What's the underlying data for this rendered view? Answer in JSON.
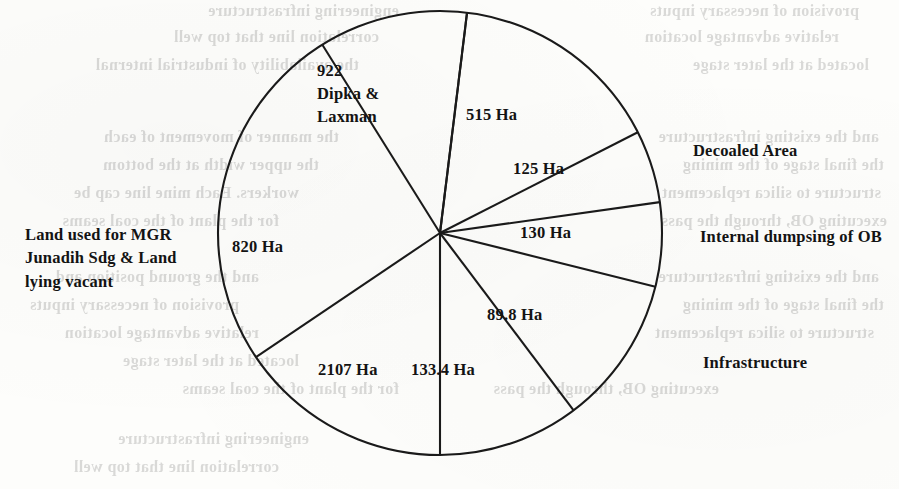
{
  "document": {
    "type": "scanned-page-pie-chart",
    "ink_color": "#1a1a1a",
    "paper_color": "#fdfdfb"
  },
  "chart_data": {
    "type": "pie",
    "title": "",
    "unit": "Ha",
    "legend_position": "callout-labels",
    "grid": false,
    "categories": [
      "515 Ha",
      "125 Ha",
      "130 Ha",
      "89.8 Ha",
      "133.4 Ha",
      "2107 Ha",
      "820 Ha",
      "922 Dipka & Laxman"
    ],
    "values": [
      515,
      125,
      130,
      89.8,
      133.4,
      2107,
      820,
      922
    ],
    "labels": [
      "515 Ha",
      "125 Ha",
      "130 Ha",
      "89.8 Ha",
      "133.4 Ha",
      "2107 Ha",
      "820 Ha",
      "922"
    ],
    "category_names": [
      "Decoaled Area",
      "",
      "Internal dumpsing of OB",
      "Infrastructure",
      "",
      "",
      "Land used for MGR Junadih Sdg & Land lying vacant",
      "Dipka & Laxman"
    ],
    "slices": [
      {
        "label": "515 Ha",
        "value": 515,
        "start_deg": -83,
        "end_deg": -27
      },
      {
        "label": "125 Ha",
        "value": 125,
        "start_deg": -27,
        "end_deg": -8
      },
      {
        "label": "130 Ha",
        "value": 130,
        "start_deg": -8,
        "end_deg": 14
      },
      {
        "label": "89.8 Ha",
        "value": 89.8,
        "start_deg": 14,
        "end_deg": 53
      },
      {
        "label": "133.4 Ha",
        "value": 133.4,
        "start_deg": 53,
        "end_deg": 90
      },
      {
        "label": "2107 Ha",
        "value": 2107,
        "start_deg": 90,
        "end_deg": 146
      },
      {
        "label": "820 Ha",
        "value": 820,
        "start_deg": 146,
        "end_deg": 238
      },
      {
        "label": "922",
        "value": 922,
        "start_deg": 238,
        "end_deg": 277
      }
    ]
  },
  "labels": {
    "v_515": "515 Ha",
    "v_125": "125 Ha",
    "v_130": "130 Ha",
    "v_898": "89.8 Ha",
    "v_1334": "133.4 Ha",
    "v_2107": "2107 Ha",
    "v_820": "820 Ha",
    "v_922": "922",
    "cat_dipka": "Dipka &\nLaxman",
    "cat_decoaled": "Decoaled Area",
    "cat_internal": "Internal dumpsing of OB",
    "cat_infrastructure": "Infrastructure",
    "cat_mgr": "Land used for MGR\nJunadih Sdg & Land\nlying vacant"
  },
  "bleed_through": {
    "note": "faint mirrored text showing through from the reverse side of the scanned page",
    "lines": [
      "provision of necessary inputs",
      "engineering infrastructure",
      "relative advantage location",
      "correlation line that top well",
      "located at the later stage",
      "the availability of industrial internal",
      "and the existing infrastructure",
      "the manner of movement of each",
      "the final stage of the mining",
      "the upper width at the bottom",
      "structure to silica replacement",
      "workers. Each mine line cap be",
      "executing OB, through the pass",
      "for the plant of the coal seams",
      "and the ground position and"
    ]
  }
}
